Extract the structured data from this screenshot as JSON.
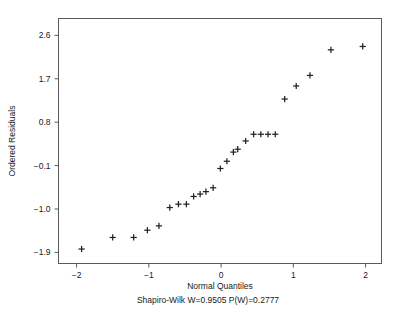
{
  "chart_data": {
    "type": "scatter",
    "title": "",
    "subtitle": "Shapiro-Wilk W=0.9505 P(W)=0.2777",
    "xlabel": "Normal Quantiles",
    "ylabel": "Ordered Residuals",
    "xlim": [
      -2.25,
      2.22
    ],
    "ylim": [
      -2.13,
      2.95
    ],
    "xticks": [
      -2,
      -1,
      0,
      1,
      2
    ],
    "xtick_labels": [
      "−2",
      "−1",
      "0",
      "1",
      "2"
    ],
    "yticks": [
      2.6,
      1.7,
      0.8,
      -0.1,
      -1.0,
      -1.9
    ],
    "ytick_labels": [
      "2.6",
      "1.7",
      "0.8",
      "−0.1",
      "−1.0",
      "−1.9"
    ],
    "grid": false,
    "legend": "none",
    "marker": "plus",
    "marker_color": "#222222",
    "frame_color": "#5a5a5a",
    "background": "#ffffff",
    "n_points": 28,
    "x": [
      -1.93,
      -1.5,
      -1.21,
      -1.02,
      -0.86,
      -0.71,
      -0.59,
      -0.48,
      -0.38,
      -0.29,
      -0.21,
      -0.11,
      -0.01,
      0.08,
      0.17,
      0.23,
      0.34,
      0.45,
      0.55,
      0.65,
      0.75,
      0.88,
      1.04,
      1.23,
      1.52,
      1.96
    ],
    "y": [
      -1.83,
      -1.59,
      -1.59,
      -1.44,
      -1.35,
      -0.97,
      -0.9,
      -0.9,
      -0.74,
      -0.69,
      -0.64,
      -0.56,
      -0.16,
      -0.01,
      0.18,
      0.24,
      0.41,
      0.55,
      0.55,
      0.55,
      0.55,
      1.28,
      1.55,
      1.77,
      2.3,
      2.37
    ],
    "stats": {
      "test": "Shapiro-Wilk",
      "W": 0.9505,
      "P": 0.2777,
      "W_label": "W=0.9505",
      "P_label": "P(W)=0.2777"
    }
  },
  "axes": {
    "x_title": "Normal Quantiles",
    "y_title": "Ordered Residuals"
  }
}
